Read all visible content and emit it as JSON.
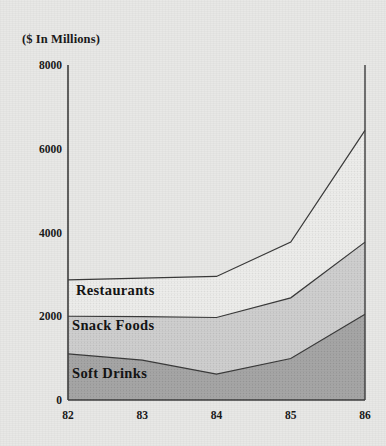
{
  "chart_data": {
    "type": "area",
    "stacked": true,
    "title": "($ In Millions)",
    "xlabel": "",
    "ylabel": "",
    "categories": [
      "82",
      "83",
      "84",
      "85",
      "86"
    ],
    "x_tick_labels": [
      "82",
      "83",
      "84",
      "85",
      "86"
    ],
    "y_tick_labels": [
      "0",
      "2000",
      "4000",
      "6000",
      "8000"
    ],
    "y_ticks": [
      0,
      2000,
      4000,
      6000,
      8000
    ],
    "ylim": [
      0,
      8000
    ],
    "grid": false,
    "legend_position": "inside-areas",
    "series": [
      {
        "name": "Soft Drinks",
        "label": "Soft Drinks",
        "color": "#a6a6a6",
        "values": [
          1100,
          950,
          620,
          990,
          2050
        ],
        "cumulative": [
          1100,
          950,
          620,
          990,
          2050
        ]
      },
      {
        "name": "Snack Foods",
        "label": "Snack Foods",
        "color": "#cfcfcf",
        "values": [
          900,
          1040,
          1350,
          1450,
          1720
        ],
        "cumulative": [
          2000,
          1990,
          1970,
          2440,
          3770
        ]
      },
      {
        "name": "Restaurants",
        "label": "Restaurants",
        "color": "#ececea",
        "values": [
          870,
          920,
          980,
          1330,
          2670
        ],
        "cumulative": [
          2870,
          2910,
          2950,
          3770,
          6440
        ]
      }
    ],
    "axis_color": "#3d3d3d",
    "background_color": "#e8e8e6"
  },
  "labels": {
    "restaurants": "Restaurants",
    "snack_foods": "Snack Foods",
    "soft_drinks": "Soft Drinks"
  }
}
